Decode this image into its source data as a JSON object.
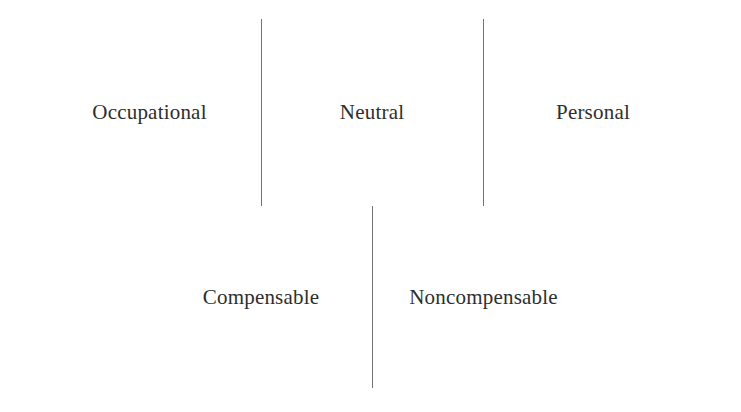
{
  "diagram": {
    "background_color": "#ffffff",
    "line_color": "#5b5b5b",
    "text_color": "#2e2e2e",
    "rows": [
      {
        "name": "top-row",
        "cells": [
          {
            "label": "Occupational"
          },
          {
            "label": "Neutral"
          },
          {
            "label": "Personal"
          }
        ]
      },
      {
        "name": "bottom-row",
        "cells": [
          {
            "label": "Compensable"
          },
          {
            "label": "Noncompensable"
          }
        ]
      }
    ]
  }
}
